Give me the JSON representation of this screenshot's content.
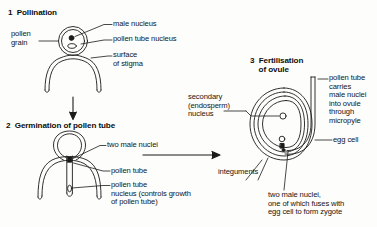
{
  "figure": {
    "ink_color": "#1b1b1b",
    "background_color": "#fdfdfb"
  },
  "stages": [
    {
      "number": "1",
      "heading": "1  Pollination",
      "labels": {
        "pollen_grain": "pollen\ngrain",
        "male_nucleus": "male nucleus",
        "pollen_tube_nucleus": "pollen tube nucleus",
        "surface_of_stigma": "surface\nof stigma"
      }
    },
    {
      "number": "2",
      "heading": "2  Germination of pollen tube",
      "labels": {
        "two_male_nuclei": "two male nuclei",
        "pollen_tube": "pollen tube",
        "pollen_tube_nucleus": "pollen tube\nnucleus (controls growth\nof pollen tube)"
      }
    },
    {
      "number": "3",
      "heading": "3  Fertilisation\n    of ovule",
      "labels": {
        "secondary_nucleus": "secondary\n(endosperm)\nnucleus",
        "pollen_tube_carries": "pollen tube\ncarries\nmale nuclei\ninto ovule\nthrough\nmicropyle",
        "egg_cell": "egg cell",
        "integuments": "integuments",
        "two_male_nuclei_zygote": "two male nuclei,\none of which fuses with\negg cell to form zygote"
      }
    }
  ],
  "connectors": {
    "stage1_to_stage2": "down-arrow",
    "stage2_to_stage3": "right-arrow"
  }
}
